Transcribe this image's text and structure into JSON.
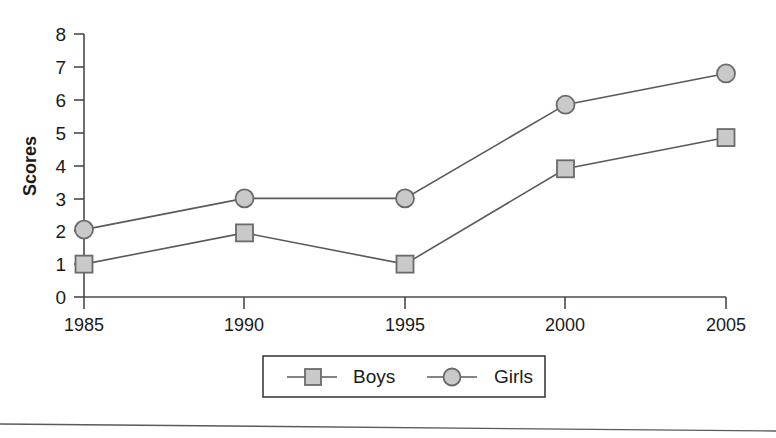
{
  "chart_data": {
    "type": "line",
    "title": "",
    "xlabel": "",
    "ylabel": "Scores",
    "categories": [
      "1985",
      "1990",
      "1995",
      "2000",
      "2005"
    ],
    "x": [
      1985,
      1990,
      1995,
      2000,
      2005
    ],
    "xlim": [
      1985,
      2005
    ],
    "ylim": [
      0,
      8
    ],
    "yticks": [
      "0",
      "1",
      "2",
      "3",
      "4",
      "5",
      "6",
      "7",
      "8"
    ],
    "grid": false,
    "legend_position": "bottom-center",
    "series": [
      {
        "name": "Boys",
        "marker": "square",
        "marker_fill": "#c9c9c9",
        "marker_stroke": "#6a6a6a",
        "line_color": "#5a5a5a",
        "values": [
          1.0,
          1.95,
          1.0,
          3.9,
          4.85
        ]
      },
      {
        "name": "Girls",
        "marker": "circle",
        "marker_fill": "#c9c9c9",
        "marker_stroke": "#6a6a6a",
        "line_color": "#5a5a5a",
        "values": [
          2.05,
          3.0,
          3.0,
          5.85,
          6.8
        ]
      }
    ]
  },
  "axis": {
    "y_title": "Scores",
    "y_tick_8": "8",
    "y_tick_7": "7",
    "y_tick_6": "6",
    "y_tick_5": "5",
    "y_tick_4": "4",
    "y_tick_3": "3",
    "y_tick_2": "2",
    "y_tick_1": "1",
    "y_tick_0": "0",
    "x_tick_0": "1985",
    "x_tick_1": "1990",
    "x_tick_2": "1995",
    "x_tick_3": "2000",
    "x_tick_4": "2005"
  },
  "legend": {
    "item_boys": "Boys",
    "item_girls": "Girls"
  }
}
